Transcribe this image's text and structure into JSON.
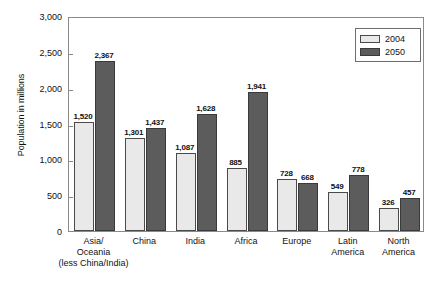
{
  "chart_data": {
    "type": "bar",
    "title": "",
    "subtitle": "",
    "xlabel": "",
    "ylabel": "Population in millions",
    "ylim": [
      0,
      3000
    ],
    "ytick_values": [
      0,
      500,
      1000,
      1500,
      2000,
      2500,
      3000
    ],
    "ytick_labels": [
      "0",
      "500",
      "1,000",
      "1,500",
      "2,000",
      "2,500",
      "3,000"
    ],
    "grid": false,
    "legend_position": "top-right",
    "categories": [
      "Asia/ Oceania (less China/India)",
      "China",
      "India",
      "Africa",
      "Europe",
      "Latin America",
      "North America"
    ],
    "category_lines": [
      [
        "Asia/",
        "Oceania",
        "(less China/India)"
      ],
      [
        "China",
        "",
        ""
      ],
      [
        "India",
        "",
        ""
      ],
      [
        "Africa",
        "",
        ""
      ],
      [
        "Europe",
        "",
        ""
      ],
      [
        "Latin",
        "America",
        ""
      ],
      [
        "North",
        "America",
        ""
      ]
    ],
    "series": [
      {
        "name": "2004",
        "color": "#e9e9e9",
        "values": [
          1520,
          1301,
          1087,
          885,
          728,
          549,
          326
        ],
        "labels": [
          "1,520",
          "1,301",
          "1,087",
          "885",
          "728",
          "549",
          "326"
        ]
      },
      {
        "name": "2050",
        "color": "#5c5c5c",
        "values": [
          2367,
          1437,
          1628,
          1941,
          668,
          778,
          457
        ],
        "labels": [
          "2,367",
          "1,437",
          "1,628",
          "1,941",
          "668",
          "778",
          "457"
        ]
      }
    ]
  },
  "legend": {
    "entries": [
      {
        "label": "2004"
      },
      {
        "label": "2050"
      }
    ]
  }
}
